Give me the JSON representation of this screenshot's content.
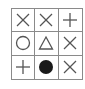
{
  "puzzle": {
    "rows": 3,
    "cols": 3,
    "cells": [
      [
        "cross",
        "cross",
        "plus"
      ],
      [
        "circle",
        "triangle",
        "cross"
      ],
      [
        "plus",
        "filled-circle",
        "cross"
      ]
    ],
    "colors": {
      "line": "#8a8a8a",
      "symbol": "#555555",
      "fill": "#1a1a1a"
    }
  }
}
